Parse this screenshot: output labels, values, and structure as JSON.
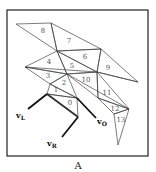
{
  "figure": {
    "caption": "A",
    "triangles": [
      {
        "id": "0",
        "label": "0",
        "pts": [
          [
            47,
            94
          ],
          [
            77,
            98
          ],
          [
            78,
            117
          ]
        ],
        "lx": 70,
        "ly": 103
      },
      {
        "id": "1",
        "label": "1",
        "pts": [
          [
            50,
            84
          ],
          [
            47,
            94
          ],
          [
            77,
            98
          ]
        ],
        "lx": 56,
        "ly": 90
      },
      {
        "id": "2",
        "label": "2",
        "pts": [
          [
            50,
            84
          ],
          [
            67,
            74
          ],
          [
            77,
            98
          ]
        ],
        "lx": 64,
        "ly": 83
      },
      {
        "id": "3",
        "label": "3",
        "pts": [
          [
            25,
            67
          ],
          [
            67,
            74
          ],
          [
            50,
            84
          ]
        ],
        "lx": 48,
        "ly": 76
      },
      {
        "id": "4",
        "label": "4",
        "pts": [
          [
            25,
            67
          ],
          [
            57,
            51
          ],
          [
            67,
            74
          ]
        ],
        "lx": 49,
        "ly": 62
      },
      {
        "id": "5",
        "label": "5",
        "pts": [
          [
            57,
            51
          ],
          [
            97,
            72
          ],
          [
            67,
            74
          ]
        ],
        "lx": 72,
        "ly": 66
      },
      {
        "id": "6",
        "label": "6",
        "pts": [
          [
            57,
            51
          ],
          [
            101,
            49
          ],
          [
            97,
            72
          ]
        ],
        "lx": 85,
        "ly": 57
      },
      {
        "id": "7",
        "label": "7",
        "pts": [
          [
            51,
            23
          ],
          [
            101,
            49
          ],
          [
            57,
            51
          ]
        ],
        "lx": 69,
        "ly": 41
      },
      {
        "id": "8",
        "label": "8",
        "pts": [
          [
            16,
            24
          ],
          [
            51,
            23
          ],
          [
            57,
            51
          ]
        ],
        "lx": 43,
        "ly": 31
      },
      {
        "id": "9",
        "label": "9",
        "pts": [
          [
            101,
            49
          ],
          [
            138,
            82
          ],
          [
            97,
            72
          ]
        ],
        "lx": 108,
        "ly": 68
      },
      {
        "id": "10",
        "label": "10",
        "pts": [
          [
            67,
            74
          ],
          [
            97,
            72
          ],
          [
            98,
            98
          ]
        ],
        "lx": 86,
        "ly": 80
      },
      {
        "id": "11",
        "label": "11",
        "pts": [
          [
            97,
            72
          ],
          [
            98,
            98
          ],
          [
            129,
            109
          ]
        ],
        "lx": 107,
        "ly": 93
      },
      {
        "id": "12",
        "label": "12",
        "pts": [
          [
            98,
            98
          ],
          [
            129,
            109
          ],
          [
            114,
            114
          ]
        ],
        "lx": 115,
        "ly": 109
      },
      {
        "id": "13",
        "label": "13",
        "pts": [
          [
            114,
            114
          ],
          [
            129,
            109
          ],
          [
            118,
            145
          ]
        ],
        "lx": 121,
        "ly": 120
      }
    ],
    "extra_edges": [
      [
        [
          67,
          74
        ],
        [
          129,
          109
        ]
      ],
      [
        [
          97,
          72
        ],
        [
          138,
          82
        ]
      ],
      [
        [
          25,
          67
        ],
        [
          97,
          72
        ]
      ]
    ],
    "thick_edges": [
      [
        [
          47,
          94
        ],
        [
          78,
          117
        ]
      ]
    ],
    "vectors": [
      {
        "name": "vL",
        "base": "v",
        "sub": "L",
        "from": [
          47,
          94
        ],
        "to": [
          28,
          109
        ],
        "lx": 16,
        "ly": 118
      },
      {
        "name": "vR",
        "base": "v",
        "sub": "R",
        "from": [
          78,
          117
        ],
        "to": [
          62,
          137
        ],
        "lx": 47,
        "ly": 146
      },
      {
        "name": "vO",
        "base": "v",
        "sub": "O",
        "from": [
          77,
          98
        ],
        "to": [
          96,
          118
        ],
        "lx": 97,
        "ly": 124
      }
    ],
    "frame": {
      "x": 7,
      "y": 10,
      "w": 141,
      "h": 146
    }
  }
}
